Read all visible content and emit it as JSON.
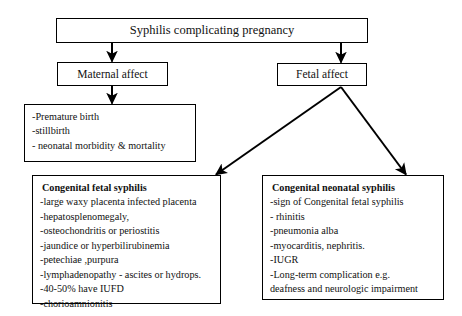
{
  "figure": {
    "title": "Syphilis complicating pregnancy",
    "stroke_color": "#000000",
    "background_color": "#ffffff"
  },
  "nodes": {
    "title": {
      "label": "Syphilis complicating pregnancy"
    },
    "maternal_affect": {
      "label": "Maternal affect"
    },
    "fetal_affect": {
      "label": "Fetal affect"
    },
    "maternal_outcomes": {
      "lines": [
        "-Premature birth",
        "-stillbirth",
        "- neonatal morbidity & mortality"
      ]
    },
    "congenital_fetal_syphilis": {
      "heading": "Congenital fetal syphilis",
      "lines": [
        "-large waxy placenta infected placenta",
        "-hepatosplenomegaly,",
        "-osteochondritis or periostitis",
        "-jaundice or hyperbilirubinemia",
        "-petechiae ,purpura",
        "-lymphadenopathy - ascites or hydrops.",
        "-40-50% have IUFD",
        "-chorioamnionitis"
      ]
    },
    "congenital_neonatal_syphilis": {
      "heading": "Congenital neonatal syphilis",
      "lines": [
        "-sign of Congenital fetal syphilis",
        "- rhinitis",
        "-pneumonia alba",
        "-myocarditis, nephritis.",
        "-IUGR",
        "-Long-term complication e.g.",
        "deafness and neurologic impairment"
      ]
    }
  },
  "edges": [
    {
      "name": "title-to-maternal-affect",
      "from": "title",
      "to": "maternal_affect"
    },
    {
      "name": "title-to-fetal-affect",
      "from": "title",
      "to": "fetal_affect"
    },
    {
      "name": "maternal-affect-to-maternal-outcomes",
      "from": "maternal_affect",
      "to": "maternal_outcomes"
    },
    {
      "name": "fetal-affect-to-congenital-fetal-syphilis",
      "from": "fetal_affect",
      "to": "congenital_fetal_syphilis"
    },
    {
      "name": "fetal-affect-to-congenital-neonatal-syphilis",
      "from": "fetal_affect",
      "to": "congenital_neonatal_syphilis"
    }
  ]
}
